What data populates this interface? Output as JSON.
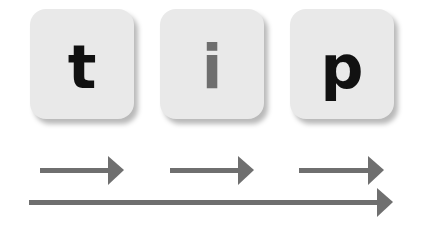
{
  "tiles": [
    {
      "letter": "t",
      "color": "#111111"
    },
    {
      "letter": "i",
      "color": "#6e6e6e"
    },
    {
      "letter": "p",
      "color": "#111111"
    }
  ],
  "colors": {
    "tile_bg": "#e9e9e9",
    "arrow": "#6f6f6f"
  },
  "arrows": [
    {
      "name": "arrow-t",
      "x1": 40,
      "x2": 124,
      "y": 170
    },
    {
      "name": "arrow-i",
      "x1": 170,
      "x2": 253,
      "y": 170
    },
    {
      "name": "arrow-p",
      "x1": 299,
      "x2": 383,
      "y": 170
    },
    {
      "name": "arrow-word",
      "x1": 29,
      "x2": 393,
      "y": 202
    }
  ]
}
